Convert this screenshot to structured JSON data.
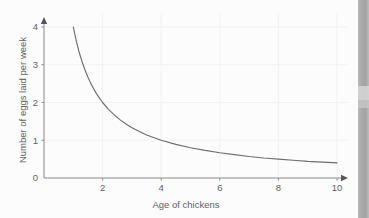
{
  "figure": {
    "background_color": "#fcfcfd",
    "axis_color": "#8a8a8d",
    "curve_color": "#6e6e71",
    "grid_color": "#f2f2f4",
    "text_color": "#5f5f62",
    "scan_strip_color": "#ababab"
  },
  "chart_data": {
    "type": "line",
    "title": "",
    "subtitle": "",
    "xlabel": "Age of chickens",
    "ylabel": "Number of eggs laid per week",
    "xlim": [
      0,
      10.6
    ],
    "ylim": [
      0,
      4.35
    ],
    "xticks": [
      2,
      4,
      6,
      8,
      10
    ],
    "xticklabels": [
      "2",
      "4",
      "6",
      "8",
      "10"
    ],
    "yticks": [
      0,
      1,
      2,
      3,
      4
    ],
    "yticklabels": [
      "0",
      "1",
      "2",
      "3",
      "4"
    ],
    "grid": true,
    "legend": false,
    "legend_position": "none",
    "annotations": [],
    "relationship": "inverse proportion, y = 4 / x",
    "series": [
      {
        "name": "Eggs laid per week",
        "x": [
          1.0,
          1.1,
          1.2,
          1.3,
          1.4,
          1.5,
          1.6,
          1.8,
          2.0,
          2.2,
          2.4,
          2.6,
          2.8,
          3.0,
          3.5,
          4.0,
          4.5,
          5.0,
          5.5,
          6.0,
          6.5,
          7.0,
          7.5,
          8.0,
          8.5,
          9.0,
          9.5,
          10.0
        ],
        "y": [
          4.0,
          3.64,
          3.33,
          3.08,
          2.86,
          2.67,
          2.5,
          2.22,
          2.0,
          1.82,
          1.67,
          1.54,
          1.43,
          1.33,
          1.14,
          1.0,
          0.89,
          0.8,
          0.73,
          0.67,
          0.62,
          0.57,
          0.53,
          0.5,
          0.47,
          0.44,
          0.42,
          0.4
        ]
      }
    ]
  },
  "axes": {
    "x_arrow": true,
    "y_arrow": true,
    "origin_label": "0"
  }
}
